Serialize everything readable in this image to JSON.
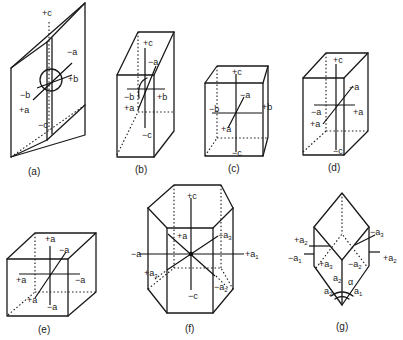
{
  "figure": {
    "panels": [
      {
        "id": "a",
        "caption": "(a)",
        "labels": {
          "plus_c": "+c",
          "minus_c": "−c",
          "minus_a": "−a",
          "plus_a": "+a",
          "plus_b": "+b",
          "minus_b": "−b"
        }
      },
      {
        "id": "b",
        "caption": "(b)",
        "labels": {
          "plus_c": "+c",
          "minus_c": "−c",
          "minus_a": "−a",
          "plus_a": "+a",
          "plus_b": "+b",
          "minus_b": "−b"
        }
      },
      {
        "id": "c",
        "caption": "(c)",
        "labels": {
          "plus_c": "+c",
          "minus_c": "−c",
          "minus_a": "−a",
          "plus_a": "+a",
          "plus_b": "+b",
          "minus_b": "−b"
        }
      },
      {
        "id": "d",
        "caption": "(d)",
        "labels": {
          "plus_c": "+c",
          "minus_c": "−c",
          "minus_a_back": "−a",
          "plus_a_front": "+a",
          "plus_a_right": "+a",
          "minus_a_left": "−a"
        }
      },
      {
        "id": "e",
        "caption": "(e)",
        "labels": {
          "plus_a_top": "+a",
          "minus_a_bottom": "−a",
          "minus_a_back": "−a",
          "plus_a_front": "+a",
          "plus_a_left": "+a",
          "minus_a_right": "−a"
        }
      },
      {
        "id": "f",
        "caption": "(f)",
        "labels": {
          "plus_c": "+c",
          "minus_c": "−c",
          "plus_a": "+a",
          "minus_a": "−a",
          "minus_a3_base": "−a",
          "minus_a3_sub": "3",
          "plus_a1_base": "+a",
          "plus_a1_sub": "1",
          "plus_a3_base": "+a",
          "plus_a3_sub": "3",
          "minus_a2_base": "−a",
          "minus_a2_sub": "2"
        }
      },
      {
        "id": "g",
        "caption": "(g)",
        "labels": {
          "plus_a2_left_base": "+a",
          "plus_a2_left_sub": "2",
          "minus_a1_base": "−a",
          "minus_a1_sub": "1",
          "minus_a3_base": "−a",
          "minus_a3_sub": "3",
          "plus_a2_right_base": "+a",
          "plus_a2_right_sub": "2",
          "plus_a3_base": "+a",
          "plus_a3_sub": "3",
          "minus_a2_base": "−a",
          "minus_a2_sub": "2",
          "a2_mid_base": "a",
          "a2_mid_sub": "2",
          "a2_low_base": "a",
          "a2_low_sub": "2",
          "a1_base": "a",
          "a1_sub": "1",
          "alpha": "α"
        }
      }
    ]
  }
}
